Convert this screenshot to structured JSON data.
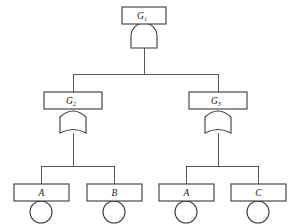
{
  "diagram": {
    "type": "fault-tree",
    "title": "",
    "colors": {
      "background": "#ffffff",
      "stroke": "#3a3a3a",
      "connector": "#55585c",
      "text": "#1a1a1a"
    },
    "nodes": {
      "top": {
        "id": "G1",
        "label": "G",
        "subscript": "1",
        "gate_type": "AND",
        "box": {
          "x": 122,
          "y": 7,
          "w": 44,
          "h": 17
        },
        "gate": {
          "cx": 144,
          "top": 24,
          "w": 26,
          "h": 24
        }
      },
      "left_gate": {
        "id": "G2",
        "label": "G",
        "subscript": "2",
        "gate_type": "OR",
        "box": {
          "x": 44,
          "y": 92,
          "w": 58,
          "h": 17
        },
        "gate": {
          "cx": 73,
          "top": 109,
          "w": 26,
          "h": 26
        }
      },
      "right_gate": {
        "id": "G3",
        "label": "G",
        "subscript": "3",
        "gate_type": "OR",
        "box": {
          "x": 189,
          "y": 92,
          "w": 58,
          "h": 17
        },
        "gate": {
          "cx": 218,
          "top": 109,
          "w": 26,
          "h": 26
        }
      }
    },
    "basic_events": [
      {
        "id": "A-left",
        "label": "A",
        "box": {
          "x": 14,
          "y": 184,
          "w": 55,
          "h": 17
        },
        "circle": {
          "cx": 41,
          "cy": 212,
          "r": 11
        }
      },
      {
        "id": "B",
        "label": "B",
        "box": {
          "x": 87,
          "y": 184,
          "w": 55,
          "h": 17
        },
        "circle": {
          "cx": 114,
          "cy": 212,
          "r": 11
        }
      },
      {
        "id": "A-right",
        "label": "A",
        "box": {
          "x": 159,
          "y": 184,
          "w": 55,
          "h": 17
        },
        "circle": {
          "cx": 186,
          "cy": 212,
          "r": 11
        }
      },
      {
        "id": "C",
        "label": "C",
        "box": {
          "x": 231,
          "y": 184,
          "w": 55,
          "h": 17
        },
        "circle": {
          "cx": 258,
          "cy": 212,
          "r": 11
        }
      }
    ],
    "connectors": {
      "top_stem": {
        "x": 144,
        "y1": 48,
        "y2": 74
      },
      "top_bus": {
        "y": 74,
        "x1": 73,
        "x2": 218
      },
      "top_bus_left": {
        "x": 73,
        "y1": 74,
        "y2": 92
      },
      "top_bus_right": {
        "x": 218,
        "y1": 74,
        "y2": 92
      },
      "left_stem": {
        "x": 73,
        "y1": 135,
        "y2": 166
      },
      "left_bus": {
        "y": 166,
        "x1": 41,
        "x2": 114
      },
      "left_bus_a": {
        "x": 41,
        "y1": 166,
        "y2": 184
      },
      "left_bus_b": {
        "x": 114,
        "y1": 166,
        "y2": 184
      },
      "right_stem": {
        "x": 218,
        "y1": 135,
        "y2": 166
      },
      "right_bus": {
        "y": 166,
        "x1": 186,
        "x2": 258
      },
      "right_bus_a": {
        "x": 186,
        "y1": 166,
        "y2": 184
      },
      "right_bus_c": {
        "x": 258,
        "y1": 166,
        "y2": 184
      }
    }
  }
}
